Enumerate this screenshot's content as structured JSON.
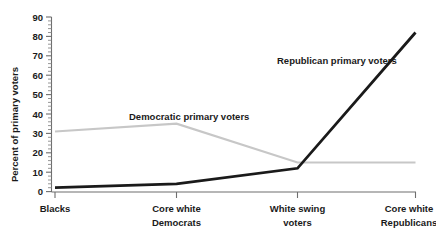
{
  "chart_data": {
    "type": "line",
    "title": "",
    "subtitle": "",
    "xlabel": "",
    "ylabel": "Percent of primary voters",
    "ylim": [
      0,
      90
    ],
    "ytick_step": 10,
    "yticks": [
      0,
      10,
      20,
      30,
      40,
      50,
      60,
      70,
      80,
      90
    ],
    "ytick_labels": [
      "0",
      "10",
      "20",
      "30",
      "40",
      "50",
      "60",
      "70",
      "80",
      "90"
    ],
    "grid": false,
    "legend_position": "inline-annotations",
    "categories": [
      "Blacks",
      "Core white Democrats",
      "White swing voters",
      "Core white Republicans"
    ],
    "category_labels": [
      [
        "Blacks"
      ],
      [
        "Core white",
        "Democrats"
      ],
      [
        "White swing",
        "voters"
      ],
      [
        "Core white",
        "Republicans"
      ]
    ],
    "series": [
      {
        "name": "Democratic primary voters",
        "color": "#c7c7c7",
        "values": [
          31,
          35,
          15,
          15
        ]
      },
      {
        "name": "Republican primary voters",
        "color": "#1a1a1a",
        "values": [
          2,
          4,
          12,
          82
        ]
      }
    ],
    "annotations": [
      {
        "text": "Democratic primary voters",
        "x": 129,
        "y": 120
      },
      {
        "text": "Republican primary voters",
        "x": 277,
        "y": 64
      }
    ]
  },
  "axis": {
    "y_title": "Percent of primary voters",
    "y_labels": [
      "90",
      "80",
      "70",
      "60",
      "50",
      "40",
      "30",
      "20",
      "10",
      "0"
    ],
    "x_labels_line1": [
      "Blacks",
      "Core white",
      "White swing",
      "Core white"
    ],
    "x_labels_line2": [
      "",
      "Democrats",
      "voters",
      "Republicans"
    ]
  },
  "colors": {
    "democratic_line": "#c7c7c7",
    "republican_line": "#1a1a1a",
    "axis": "#6e6e6e",
    "text": "#1a1a1a",
    "background": "#ffffff"
  }
}
